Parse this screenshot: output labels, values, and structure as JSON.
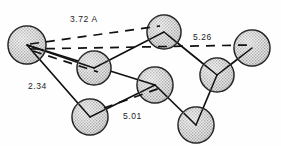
{
  "figure": {
    "name": "atomic-structure-diagram",
    "background_color": "#fefefe",
    "sphere_fill_color": "#d0d0d0",
    "sphere_stroke_color": "#1a1a1a",
    "bond_color": "#111111",
    "dashed_color": "#111111",
    "label_color": "#1a1a1a"
  },
  "labels": {
    "d1": "3.72 A",
    "d2": "5.26",
    "d3": "2.34",
    "d4": "5.01"
  },
  "chart_data": {
    "type": "scatter",
    "title": "",
    "xlabel": "",
    "ylabel": "",
    "grid": false,
    "legend": null,
    "atoms": [
      {
        "id": "a1",
        "name": "atom-upper-left",
        "cx": 27,
        "cy": 45,
        "r": 19
      },
      {
        "id": "a2",
        "name": "atom-mid-left",
        "cx": 94,
        "cy": 68,
        "r": 17
      },
      {
        "id": "a3",
        "name": "atom-top-center",
        "cx": 164,
        "cy": 32,
        "r": 17
      },
      {
        "id": "a4",
        "name": "atom-right-upper",
        "cx": 252,
        "cy": 48,
        "r": 18
      },
      {
        "id": "a5",
        "name": "atom-right-mid",
        "cx": 217,
        "cy": 75,
        "r": 17
      },
      {
        "id": "a6",
        "name": "atom-center",
        "cx": 155,
        "cy": 85,
        "r": 18
      },
      {
        "id": "a7",
        "name": "atom-bottom-left",
        "cx": 90,
        "cy": 117,
        "r": 18
      },
      {
        "id": "a8",
        "name": "atom-bottom-right",
        "cx": 196,
        "cy": 125,
        "r": 18
      }
    ],
    "bonds": [
      {
        "name": "bond-a1-a2",
        "from": "a1",
        "to": "a2"
      },
      {
        "name": "bond-a1-a7",
        "from": "a1",
        "to": "a7"
      },
      {
        "name": "bond-a1-a6",
        "from": "a1",
        "to": "a6"
      },
      {
        "name": "bond-a2-a3",
        "from": "a2",
        "to": "a3"
      },
      {
        "name": "bond-a3-a5",
        "from": "a3",
        "to": "a5"
      },
      {
        "name": "bond-a5-a4",
        "from": "a5",
        "to": "a4"
      },
      {
        "name": "bond-a5-a8",
        "from": "a5",
        "to": "a8"
      },
      {
        "name": "bond-a6-a8",
        "from": "a6",
        "to": "a8"
      },
      {
        "name": "bond-a6-a7",
        "from": "a6",
        "to": "a7"
      }
    ],
    "measurements": [
      {
        "name": "distance-3-72",
        "label": "3.72 A",
        "value": 3.72,
        "unit": "A",
        "from": "a1",
        "to": "a3",
        "x1": 30,
        "y1": 44,
        "x2": 160,
        "y2": 26,
        "label_x": 70,
        "label_y": 22
      },
      {
        "name": "distance-5-26",
        "label": "5.26",
        "value": 5.26,
        "unit": "A",
        "from": "a1",
        "to": "a4",
        "x1": 30,
        "y1": 49,
        "x2": 250,
        "y2": 45,
        "label_x": 193,
        "label_y": 40
      },
      {
        "name": "distance-2-34",
        "label": "2.34",
        "value": 2.34,
        "unit": "A",
        "from": "a1",
        "to": "a2",
        "x1": 33,
        "y1": 51,
        "x2": 98,
        "y2": 72,
        "label_x": 28,
        "label_y": 89
      },
      {
        "name": "distance-5-01",
        "label": "5.01",
        "value": 5.01,
        "unit": "A",
        "from": "a7",
        "to": "a6",
        "x1": 104,
        "y1": 108,
        "x2": 160,
        "y2": 88,
        "label_x": 123,
        "label_y": 119
      }
    ]
  }
}
